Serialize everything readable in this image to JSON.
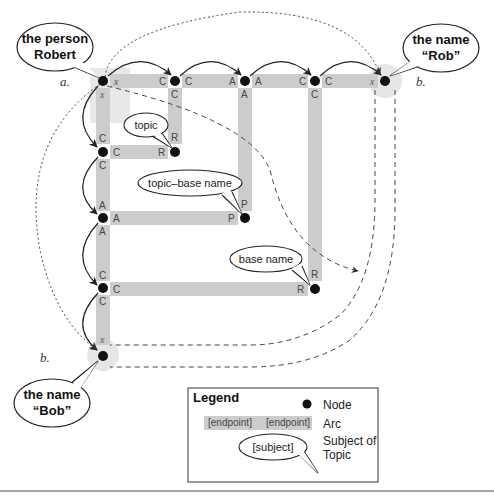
{
  "diagram": {
    "bubbles": {
      "person_robert": {
        "line1": "the person",
        "line2": "Robert"
      },
      "name_rob": {
        "line1": "the name",
        "line2": "“Rob”"
      },
      "name_bob": {
        "line1": "the name",
        "line2": "“Bob”"
      },
      "topic": "topic",
      "topic_base_name": "topic–base name",
      "base_name": "base name"
    },
    "point_labels": {
      "a": "a.",
      "b_top": "b.",
      "b_bottom": "b."
    },
    "arc_labels": {
      "x": "x",
      "C": "C",
      "A": "A",
      "R": "R",
      "P": "P"
    }
  },
  "legend": {
    "title": "Legend",
    "node_label": "Node",
    "arc_left": "[endpoint]",
    "arc_right": "[endpoint]",
    "arc_label": "Arc",
    "subject_bubble": "[subject]",
    "subject_line1": "Subject of",
    "subject_line2": "Topic"
  }
}
